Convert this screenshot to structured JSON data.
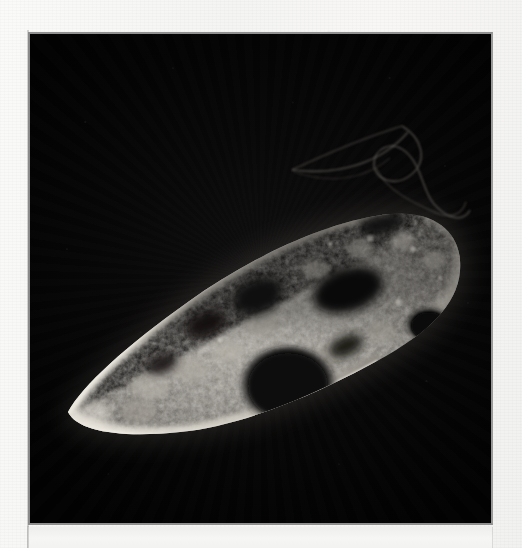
{
  "page": {
    "background_color": "#f5f5f3",
    "kind": "scanned-book-page"
  },
  "plate": {
    "border_color": "#8b8b8b",
    "field_color": "#060606",
    "x": 28,
    "y": 32,
    "width": 465,
    "height": 493,
    "imaging_mode": "dark-field photomicrograph"
  },
  "caption": {
    "text": ""
  },
  "specimen": {
    "name": "ciliate-protozoan",
    "highlight_color": "#d8d4cc",
    "midtone_color": "#8d8a84",
    "shadow_color": "#121110",
    "orientation_degrees": -22,
    "features": [
      {
        "name": "posterior-tip",
        "cx": 66,
        "cy": 404
      },
      {
        "name": "anterior-end",
        "cx": 440,
        "cy": 258
      },
      {
        "name": "cortical-rim",
        "label": "bright pellicle outline"
      },
      {
        "name": "macronucleus-vacuole",
        "cx": 258,
        "cy": 352,
        "rx": 48,
        "ry": 40
      },
      {
        "name": "contractile-vacuole",
        "cx": 399,
        "cy": 292,
        "rx": 22,
        "ry": 18
      },
      {
        "name": "dark-food-vacuole",
        "cx": 318,
        "cy": 258,
        "rx": 34,
        "ry": 22
      },
      {
        "name": "granular-cytoplasm",
        "label": "dense granule field"
      },
      {
        "name": "flagellum-upper",
        "label": "straight filament toward upper-left"
      },
      {
        "name": "flagellum-coil",
        "label": "S-shaped coiled filament at anterior"
      }
    ]
  }
}
